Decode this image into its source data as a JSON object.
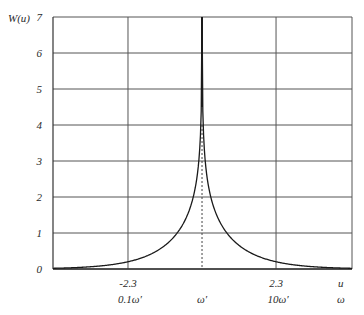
{
  "chart_data": {
    "type": "line",
    "title": "",
    "ylabel": "W(u)",
    "xlabel": "u",
    "xlabel_secondary": "ω",
    "function": "W(u) = ln(coth(|u|/2))",
    "xlim": [
      -4.63,
      4.66
    ],
    "ylim": [
      0,
      7
    ],
    "grid": true,
    "legend": null,
    "y_ticks": [
      "0",
      "1",
      "2",
      "3",
      "4",
      "5",
      "6",
      "7"
    ],
    "x_ticks": [
      {
        "u": -2.3,
        "label": "-2.3",
        "omega_label": "0.1ω′"
      },
      {
        "u": 0,
        "label": "",
        "omega_label": "ω′"
      },
      {
        "u": 2.3,
        "label": "2.3",
        "omega_label": "10ω′"
      }
    ],
    "x_axis_end_label": "u",
    "x_axis_end_omega_label": "ω",
    "center_line": {
      "u": 0,
      "style": "dashed"
    },
    "series": [
      {
        "name": "W(u)",
        "x": [
          -4.6,
          -4.0,
          -3.5,
          -3.0,
          -2.5,
          -2.3,
          -2.0,
          -1.5,
          -1.2,
          -1.0,
          -0.8,
          -0.6,
          -0.5,
          -0.4,
          -0.3,
          -0.2,
          -0.15,
          -0.1,
          -0.06,
          -0.035,
          0,
          0.035,
          0.06,
          0.1,
          0.15,
          0.2,
          0.3,
          0.4,
          0.5,
          0.6,
          0.8,
          1.0,
          1.2,
          1.5,
          2.0,
          2.3,
          2.5,
          3.0,
          3.5,
          4.0,
          4.6
        ],
        "values": [
          0.02,
          0.04,
          0.06,
          0.1,
          0.16,
          0.2,
          0.27,
          0.45,
          0.6,
          0.77,
          0.98,
          1.24,
          1.42,
          1.62,
          1.9,
          2.3,
          2.59,
          2.99,
          3.5,
          4.04,
          7.0,
          4.04,
          3.5,
          2.99,
          2.59,
          2.3,
          1.9,
          1.62,
          1.42,
          1.24,
          0.98,
          0.77,
          0.6,
          0.45,
          0.27,
          0.2,
          0.16,
          0.1,
          0.06,
          0.04,
          0.02
        ]
      }
    ]
  },
  "layout": {
    "plot_left": 53,
    "plot_right": 352,
    "plot_top": 17,
    "plot_bottom": 269,
    "colors": {
      "grid": "#555555",
      "curve": "#1a1a1a",
      "axis": "#333333"
    }
  }
}
